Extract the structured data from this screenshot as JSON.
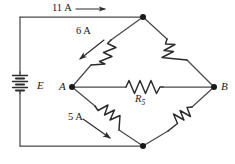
{
  "figure": {
    "type": "circuit-diagram",
    "name": "wheatstone-bridge-circuit",
    "width": 235,
    "height": 164,
    "background_color": "#ffffff",
    "line_color": "#3a3a3a",
    "text_color": "#1a1a1a"
  },
  "labels": {
    "current_top": "11 A",
    "current_upper_left_branch": "6 A",
    "current_lower_left_branch": "5 A",
    "node_a": "A",
    "node_b": "B",
    "source": "E",
    "resistor_bridge": "R",
    "resistor_bridge_subscript": "5"
  },
  "components": [
    {
      "name": "voltage-source-battery",
      "kind": "battery",
      "label": "E",
      "orientation": "vertical",
      "position": {
        "x": 20,
        "y": 82
      },
      "cells": 3
    },
    {
      "name": "resistor-upper-left",
      "kind": "resistor",
      "label": "",
      "branch": "top-node-to-node-a",
      "current_label": "6 A"
    },
    {
      "name": "resistor-upper-right",
      "kind": "resistor",
      "label": "",
      "branch": "top-node-to-node-b",
      "current_label": ""
    },
    {
      "name": "resistor-lower-left",
      "kind": "resistor",
      "label": "",
      "branch": "node-a-to-bottom-node",
      "current_label": "5 A"
    },
    {
      "name": "resistor-lower-right",
      "kind": "resistor",
      "label": "",
      "branch": "node-b-to-bottom-node",
      "current_label": ""
    },
    {
      "name": "resistor-bridge-r5",
      "kind": "resistor",
      "label": "R5",
      "branch": "node-a-to-node-b",
      "current_label": ""
    }
  ],
  "nodes": [
    {
      "name": "node-top",
      "label": "",
      "x": 143,
      "y": 17
    },
    {
      "name": "node-bottom",
      "label": "",
      "x": 143,
      "y": 146
    },
    {
      "name": "node-a",
      "label": "A",
      "x": 72,
      "y": 87
    },
    {
      "name": "node-b",
      "label": "B",
      "x": 214,
      "y": 87
    }
  ],
  "current_arrows": [
    {
      "name": "arrow-current-top",
      "label": "11 A",
      "direction": "right",
      "from": [
        75,
        9
      ],
      "to": [
        107,
        9
      ]
    },
    {
      "name": "arrow-current-upper",
      "label": "6 A",
      "direction": "down-left",
      "from": [
        104,
        40
      ],
      "to": [
        78,
        60
      ]
    },
    {
      "name": "arrow-current-lower",
      "label": "5 A",
      "direction": "down-right",
      "from": [
        83,
        119
      ],
      "to": [
        112,
        140
      ]
    }
  ],
  "wires": [
    {
      "name": "wire-top",
      "path": "from top-left corner (20,17) to node-top (143,17)"
    },
    {
      "name": "wire-left-upper",
      "path": "from (20,17) down to battery top (20,72)"
    },
    {
      "name": "wire-left-lower",
      "path": "from battery bottom (20,93) down to (20,146)"
    },
    {
      "name": "wire-bottom",
      "path": "from (20,146) to node-bottom (143,146)"
    },
    {
      "name": "wire-branch-top-a",
      "path": "node-top to node-a"
    },
    {
      "name": "wire-branch-top-b",
      "path": "node-top to node-b"
    },
    {
      "name": "wire-branch-a-bottom",
      "path": "node-a to node-bottom"
    },
    {
      "name": "wire-branch-b-bottom",
      "path": "node-b to node-bottom"
    },
    {
      "name": "wire-bridge",
      "path": "node-a to node-b through R5"
    }
  ]
}
